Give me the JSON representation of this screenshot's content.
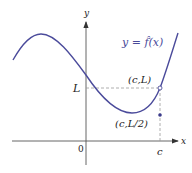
{
  "diagram": {
    "function_label": "y = f̂(x)",
    "function_label_parts": {
      "y": "y",
      "eq": "=",
      "f": "f",
      "arg": "(x)"
    },
    "axes": {
      "x_label": "x",
      "y_label": "y",
      "origin_label": "0"
    },
    "ticks": {
      "L_label": "L",
      "c_label": "c"
    },
    "points": {
      "open_point_label": "(c,L)",
      "filled_point_label": "(c,L/2)"
    },
    "colors": {
      "curve": "#4b4b9b",
      "axes": "#555555",
      "dashed": "#999999",
      "dot": "#3b3b8b"
    }
  }
}
